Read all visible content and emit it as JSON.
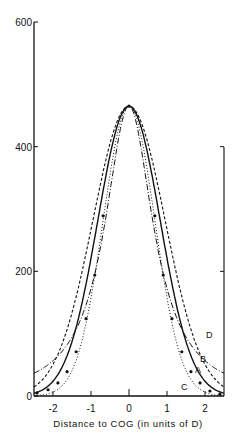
{
  "chart_data": {
    "type": "line",
    "title": "",
    "xlabel": "Distance to COG (in units of D)",
    "ylabel": "",
    "xlim": [
      -2.5,
      2.5
    ],
    "ylim": [
      0,
      600
    ],
    "x_ticks": [
      -2,
      -1,
      0,
      1,
      2
    ],
    "x_tick_labels": [
      "-2",
      "-1",
      "0",
      "1",
      "2"
    ],
    "y_ticks": [
      0,
      200,
      400,
      600
    ],
    "y_tick_labels": [
      "0",
      "200",
      "400",
      "600"
    ],
    "grid": false,
    "legend": "inline curve labels at right",
    "series": [
      {
        "name": "A",
        "style": "solid",
        "peak": 465,
        "sigma": 0.82,
        "edge_value": 10
      },
      {
        "name": "B",
        "style": "dashed",
        "peak": 465,
        "sigma": 0.95,
        "edge_value": 21
      },
      {
        "name": "C",
        "style": "dotted",
        "peak": 465,
        "sigma": 0.68,
        "edge_value": 1
      },
      {
        "name": "D",
        "style": "dash-dot",
        "peak": 465,
        "lorentz_width": 0.78,
        "edge_value": 70
      }
    ],
    "points": {
      "name": "measured",
      "x": [
        -2.42,
        -2.13,
        -1.87,
        -1.63,
        -1.39,
        -1.13,
        -0.9,
        -0.68,
        0.0,
        0.68,
        0.9,
        1.13,
        1.39,
        1.63,
        1.87,
        2.13,
        2.39
      ],
      "y": [
        5,
        10,
        21,
        39,
        71,
        124,
        194,
        289,
        465,
        289,
        194,
        124,
        71,
        39,
        21,
        8,
        3
      ]
    }
  },
  "labels": {
    "A": "A",
    "B": "B",
    "C": "C",
    "D": "D"
  }
}
